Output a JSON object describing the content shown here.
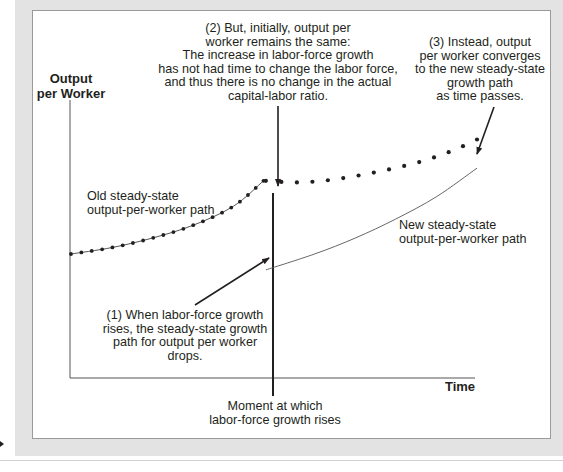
{
  "axes": {
    "y_label_line1": "Output",
    "y_label_line2": "per Worker",
    "x_label": "Time"
  },
  "annotations": {
    "note2": [
      "(2) But, initially, output per",
      "worker remains the same:",
      "The increase in labor-force growth",
      "has not had time to change the labor force,",
      "and thus there is no change in the actual",
      "capital-labor ratio."
    ],
    "note3": [
      "(3) Instead, output",
      "per worker converges",
      "to the new steady-state",
      "growth path",
      "as time passes."
    ],
    "note1": [
      "(1) When labor-force growth",
      "rises, the steady-state growth",
      "path for output per worker",
      "drops."
    ],
    "moment": [
      "Moment at which",
      "labor-force growth rises"
    ],
    "old_path_label": [
      "Old steady-state",
      "output-per-worker path"
    ],
    "new_path_label": [
      "New steady-state",
      "output-per-worker path"
    ]
  },
  "chart_data": {
    "type": "line",
    "title": "",
    "xlabel": "Time",
    "ylabel": "Output per Worker",
    "grid": false,
    "x_range": [
      0,
      100
    ],
    "y_range": [
      0,
      100
    ],
    "shock_time": 47.4,
    "series": [
      {
        "name": "Old steady-state output-per-worker path",
        "style": "solid-thin-with-dots",
        "x": [
          0,
          10,
          20,
          30,
          40,
          47.4
        ],
        "y": [
          39,
          41,
          44,
          48,
          54,
          62
        ]
      },
      {
        "name": "New steady-state output-per-worker path",
        "style": "solid-thin",
        "x": [
          48,
          60,
          70,
          80,
          90,
          100
        ],
        "y": [
          34,
          39,
          44,
          50,
          57,
          66
        ]
      },
      {
        "name": "Actual output per worker (transition)",
        "style": "dotted",
        "x": [
          48,
          55,
          62,
          70,
          78,
          86,
          94,
          100
        ],
        "y": [
          62,
          61.5,
          62,
          63.5,
          65.5,
          68,
          71.5,
          75
        ]
      }
    ]
  }
}
